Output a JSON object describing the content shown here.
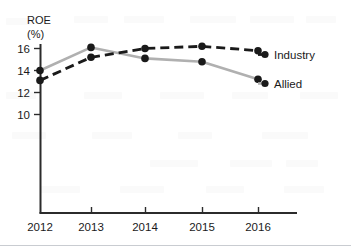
{
  "chart_data": {
    "type": "line",
    "title": "",
    "xlabel": "",
    "ylabel": "ROE",
    "ylabel_unit": "(%)",
    "categories": [
      "2012",
      "2013",
      "2014",
      "2015",
      "2016"
    ],
    "x": [
      2012,
      2013,
      2014,
      2015,
      2016
    ],
    "ylim": [
      8,
      17
    ],
    "yticks": [
      10,
      12,
      14,
      16
    ],
    "ytick_labels": [
      "10",
      "12",
      "14",
      "16"
    ],
    "grid": false,
    "legend_position": "right-inline",
    "series": [
      {
        "name": "Industry",
        "values": [
          13.1,
          15.2,
          16.0,
          16.2,
          15.8
        ],
        "color": "#1a1a1a",
        "style": "dashed",
        "marker": "circle"
      },
      {
        "name": "Allied",
        "values": [
          14.0,
          16.1,
          15.1,
          14.8,
          13.2
        ],
        "color": "#b0b0b0",
        "style": "solid",
        "marker": "circle"
      }
    ],
    "axis_color": "#2b2b2b"
  },
  "labels": {
    "y_axis_title": "ROE",
    "y_axis_unit": "(%)",
    "ytick_10": "10",
    "ytick_12": "12",
    "ytick_14": "14",
    "ytick_16": "16",
    "xtick_2012": "2012",
    "xtick_2013": "2013",
    "xtick_2014": "2014",
    "xtick_2015": "2015",
    "xtick_2016": "2016",
    "series_industry": "Industry",
    "series_allied": "Allied"
  }
}
